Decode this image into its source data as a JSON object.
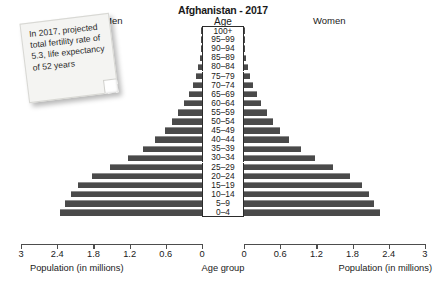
{
  "chart_data": {
    "type": "bar",
    "subtype": "population-pyramid",
    "title": "Afghanistan - 2017",
    "age_header": "Age",
    "left_series_name": "Men",
    "right_series_name": "Women",
    "xlabel_left": "Population (in millions)",
    "xlabel_center": "Age group",
    "xlabel_right": "Population (in millions)",
    "ylabel": "Age group",
    "grid": false,
    "legend": "none",
    "xlim_left": [
      3,
      0
    ],
    "xlim_right": [
      0,
      3
    ],
    "xticks_left": [
      "3",
      "2.4",
      "1.8",
      "1.2",
      "0.6",
      "0"
    ],
    "xticks_right": [
      "0",
      "0.6",
      "1.2",
      "1.8",
      "2.4",
      "3"
    ],
    "xtick_values": [
      0,
      0.6,
      1.2,
      1.8,
      2.4,
      3
    ],
    "units": "millions",
    "bar_color": "#4a4a4a",
    "categories": [
      "100+",
      "95–99",
      "90–94",
      "85–89",
      "80–84",
      "75–79",
      "70–74",
      "65–69",
      "60–64",
      "55–59",
      "50–54",
      "45–49",
      "40–44",
      "35–39",
      "30–34",
      "25–29",
      "20–24",
      "15–19",
      "10–14",
      "5–9",
      "0–4"
    ],
    "series": [
      {
        "name": "Men",
        "side": "left",
        "values": [
          0.003,
          0.008,
          0.018,
          0.035,
          0.06,
          0.1,
          0.15,
          0.22,
          0.3,
          0.4,
          0.5,
          0.62,
          0.78,
          0.98,
          1.22,
          1.52,
          1.82,
          2.05,
          2.18,
          2.28,
          2.35
        ]
      },
      {
        "name": "Women",
        "side": "right",
        "values": [
          0.003,
          0.008,
          0.018,
          0.035,
          0.06,
          0.1,
          0.15,
          0.21,
          0.29,
          0.38,
          0.48,
          0.6,
          0.75,
          0.94,
          1.18,
          1.47,
          1.76,
          1.96,
          2.08,
          2.15,
          2.25
        ]
      }
    ]
  },
  "annotation": {
    "note_text": "In 2017, projected total fertility rate of 5.3, life expectancy of 52 years"
  }
}
